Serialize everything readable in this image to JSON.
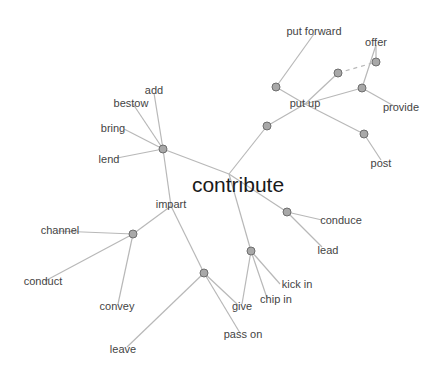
{
  "title": "contribute",
  "colors": {
    "edge": "#b8b8b8",
    "node_fill": "#a8a8a8",
    "node_stroke": "#6e6e6e",
    "label": "#444444",
    "center": "#1a1a1a"
  },
  "center": {
    "label": "contribute",
    "x": 238,
    "y": 184
  },
  "nodes": [
    {
      "id": "hub",
      "x": 229,
      "y": 174,
      "visible": false
    },
    {
      "id": "n_lend",
      "x": 163,
      "y": 149
    },
    {
      "id": "n_putup",
      "x": 267,
      "y": 126
    },
    {
      "id": "putup",
      "x": 305,
      "y": 104,
      "visible": false
    },
    {
      "id": "n_putfwd",
      "x": 276,
      "y": 87
    },
    {
      "id": "n_mid",
      "x": 338,
      "y": 73
    },
    {
      "id": "n_offer",
      "x": 376,
      "y": 62
    },
    {
      "id": "n_provide",
      "x": 362,
      "y": 88
    },
    {
      "id": "n_post",
      "x": 364,
      "y": 134
    },
    {
      "id": "n_conduce",
      "x": 287,
      "y": 212
    },
    {
      "id": "n_give",
      "x": 251,
      "y": 251
    },
    {
      "id": "impart",
      "x": 171,
      "y": 206,
      "visible": false
    },
    {
      "id": "n_channel",
      "x": 133,
      "y": 234
    },
    {
      "id": "n_passon",
      "x": 204,
      "y": 273
    }
  ],
  "edges": [
    [
      "hub",
      "n_lend"
    ],
    [
      "hub",
      "n_putup"
    ],
    [
      "hub",
      "n_conduce"
    ],
    [
      "hub",
      "n_give"
    ],
    [
      "n_putup",
      "putup"
    ],
    [
      "putup",
      "n_putfwd"
    ],
    [
      "putup",
      "n_mid"
    ],
    [
      "putup",
      "n_provide"
    ],
    [
      "putup",
      "n_post"
    ],
    [
      "n_lend",
      "impart"
    ],
    [
      "impart",
      "n_channel"
    ],
    [
      "impart",
      "n_passon"
    ]
  ],
  "leaf_edges": [
    {
      "from": "n_lend",
      "x": 154,
      "y": 93
    },
    {
      "from": "n_lend",
      "x": 133,
      "y": 104
    },
    {
      "from": "n_lend",
      "x": 124,
      "y": 129
    },
    {
      "from": "n_lend",
      "x": 117,
      "y": 158
    },
    {
      "from": "n_putfwd",
      "x": 314,
      "y": 34
    },
    {
      "from": "n_provide",
      "x": 376,
      "y": 45
    },
    {
      "from": "n_offer",
      "x": 376,
      "y": 45
    },
    {
      "from": "n_provide",
      "x": 394,
      "y": 106
    },
    {
      "from": "n_post",
      "x": 381,
      "y": 160
    },
    {
      "from": "n_conduce",
      "x": 322,
      "y": 220
    },
    {
      "from": "n_conduce",
      "x": 322,
      "y": 247
    },
    {
      "from": "n_give",
      "x": 280,
      "y": 284
    },
    {
      "from": "n_give",
      "x": 267,
      "y": 298
    },
    {
      "from": "n_give",
      "x": 242,
      "y": 304
    },
    {
      "from": "n_channel",
      "x": 58,
      "y": 231
    },
    {
      "from": "n_channel",
      "x": 45,
      "y": 281
    },
    {
      "from": "n_channel",
      "x": 118,
      "y": 304
    },
    {
      "from": "n_passon",
      "x": 240,
      "y": 333
    },
    {
      "from": "n_passon",
      "x": 237,
      "y": 304
    },
    {
      "from": "n_passon",
      "x": 127,
      "y": 347
    }
  ],
  "dashed_edges": [
    {
      "x1": 338,
      "y1": 73,
      "x2": 376,
      "y2": 62
    }
  ],
  "labels": [
    {
      "text": "add",
      "x": 154,
      "y": 90
    },
    {
      "text": "bestow",
      "x": 131,
      "y": 103
    },
    {
      "text": "bring",
      "x": 113,
      "y": 128
    },
    {
      "text": "lend",
      "x": 109,
      "y": 159
    },
    {
      "text": "impart",
      "x": 171,
      "y": 204
    },
    {
      "text": "channel",
      "x": 60,
      "y": 230
    },
    {
      "text": "conduct",
      "x": 43,
      "y": 281
    },
    {
      "text": "convey",
      "x": 117,
      "y": 306
    },
    {
      "text": "leave",
      "x": 123,
      "y": 349
    },
    {
      "text": "pass on",
      "x": 243,
      "y": 334
    },
    {
      "text": "give",
      "x": 242,
      "y": 306
    },
    {
      "text": "chip in",
      "x": 276,
      "y": 299
    },
    {
      "text": "kick in",
      "x": 297,
      "y": 284
    },
    {
      "text": "lead",
      "x": 328,
      "y": 250
    },
    {
      "text": "conduce",
      "x": 341,
      "y": 220
    },
    {
      "text": "put up",
      "x": 305,
      "y": 103
    },
    {
      "text": "put forward",
      "x": 314,
      "y": 31
    },
    {
      "text": "offer",
      "x": 376,
      "y": 42
    },
    {
      "text": "provide",
      "x": 401,
      "y": 107
    },
    {
      "text": "post",
      "x": 381,
      "y": 163
    }
  ]
}
